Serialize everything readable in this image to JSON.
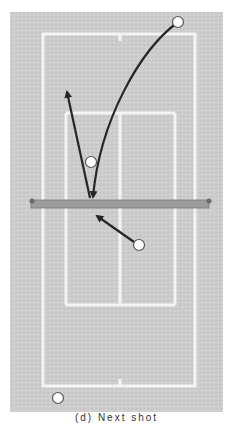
{
  "diagram": {
    "colors": {
      "surface": "#cfcfcf",
      "lines": "#f4f4f4",
      "net": "#9c9c9c",
      "net_post": "#6a6a6a",
      "path": "#262626",
      "ball_fill": "#ffffff",
      "ball_stroke": "#555555"
    },
    "balls": [
      {
        "id": "ball-top-right",
        "x": 178,
        "y": 22
      },
      {
        "id": "ball-mid-left",
        "x": 91,
        "y": 162
      },
      {
        "id": "ball-below-net",
        "x": 139,
        "y": 245
      },
      {
        "id": "ball-bottom-left",
        "x": 58,
        "y": 398
      }
    ],
    "paths": [
      {
        "id": "lob-curve",
        "type": "curve",
        "from": [
          178,
          22
        ],
        "to": [
          93,
          197
        ]
      },
      {
        "id": "deep-shot-arrow",
        "type": "line",
        "from": [
          90,
          198
        ],
        "to": [
          67,
          90
        ]
      },
      {
        "id": "approach-arrow",
        "type": "line",
        "from": [
          139,
          245
        ],
        "to": [
          95,
          215
        ]
      }
    ],
    "caption": "(d) Next shot"
  }
}
